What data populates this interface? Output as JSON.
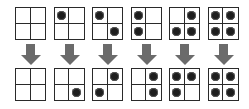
{
  "diagram": {
    "colors": {
      "grid_line": "#2a2a2a",
      "dot": "#1e1e1e",
      "arrow": "#6b6b6b",
      "background": "#ffffff"
    },
    "pairs": [
      {
        "input": [
          0,
          0,
          0,
          0
        ],
        "output": [
          0,
          0,
          0,
          0
        ]
      },
      {
        "input": [
          1,
          0,
          0,
          0
        ],
        "output": [
          0,
          0,
          0,
          1
        ]
      },
      {
        "input": [
          1,
          0,
          0,
          1
        ],
        "output": [
          0,
          1,
          1,
          0
        ]
      },
      {
        "input": [
          1,
          0,
          1,
          0
        ],
        "output": [
          0,
          1,
          0,
          1
        ]
      },
      {
        "input": [
          0,
          1,
          1,
          1
        ],
        "output": [
          1,
          1,
          1,
          0
        ]
      },
      {
        "input": [
          1,
          1,
          1,
          1
        ],
        "output": [
          1,
          1,
          1,
          1
        ]
      }
    ],
    "arrow_icon": "down-arrow-icon"
  }
}
